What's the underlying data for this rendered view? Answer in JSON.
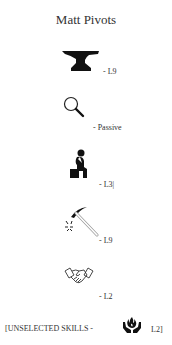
{
  "title": "Matt Pivots",
  "skills": [
    {
      "icon": "anvil-icon",
      "level": "- L9"
    },
    {
      "icon": "magnifier-icon",
      "level": "- Passive"
    },
    {
      "icon": "thinker-icon",
      "level": "- L3|"
    },
    {
      "icon": "pickaxe-icon",
      "level": "- L9"
    },
    {
      "icon": "handshake-icon",
      "level": "- L2"
    }
  ],
  "footer": {
    "prefix": "[UNSELECTED SKILLS -",
    "icon": "fire-hands-icon",
    "suffix": "L2]"
  }
}
